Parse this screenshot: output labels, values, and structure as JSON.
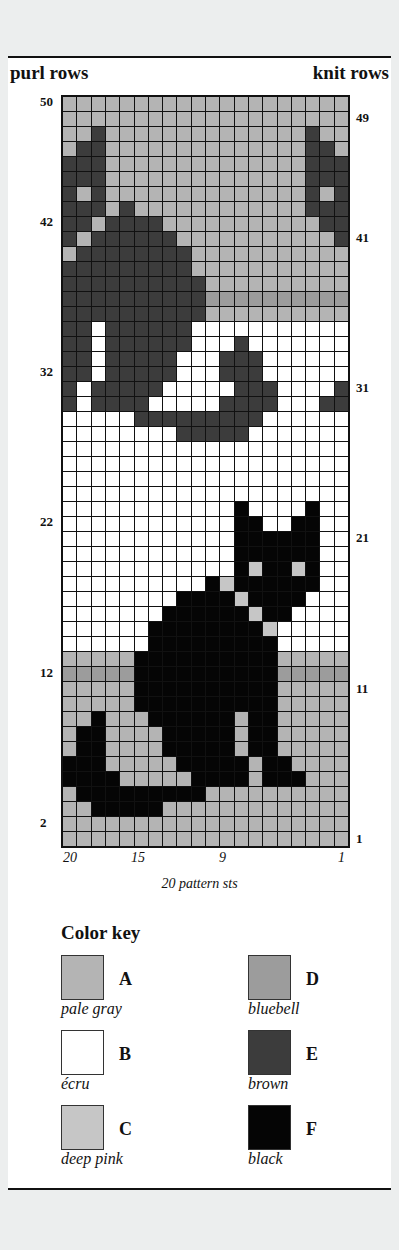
{
  "header": {
    "left": "purl rows",
    "right": "knit rows"
  },
  "row_labels_left": [
    {
      "text": "50",
      "top": 94
    },
    {
      "text": "42",
      "top": 214
    },
    {
      "text": "32",
      "top": 364
    },
    {
      "text": "22",
      "top": 514
    },
    {
      "text": "12",
      "top": 665
    },
    {
      "text": "2",
      "top": 815
    }
  ],
  "row_labels_right": [
    {
      "text": "49",
      "top": 110
    },
    {
      "text": "41",
      "top": 230
    },
    {
      "text": "31",
      "top": 380
    },
    {
      "text": "21",
      "top": 530
    },
    {
      "text": "11",
      "top": 681
    },
    {
      "text": "1",
      "top": 831
    }
  ],
  "col_labels": [
    {
      "text": "20",
      "left": 63
    },
    {
      "text": "15",
      "left": 131
    },
    {
      "text": "9",
      "left": 219
    },
    {
      "text": "1",
      "left": 338
    }
  ],
  "caption": "20 pattern sts",
  "colors": {
    "A": "#b4b4b4",
    "B": "#ffffff",
    "C": "#c6c6c6",
    "D": "#9c9c9c",
    "E": "#3c3c3c",
    "F": "#050505"
  },
  "color_key": {
    "title": "Color key",
    "items": [
      {
        "letter": "A",
        "name": "pale gray",
        "color": "#b4b4b4",
        "col": 0,
        "row": 0
      },
      {
        "letter": "B",
        "name": "écru",
        "color": "#ffffff",
        "col": 0,
        "row": 1
      },
      {
        "letter": "C",
        "name": "deep pink",
        "color": "#c6c6c6",
        "col": 0,
        "row": 2
      },
      {
        "letter": "D",
        "name": "bluebell",
        "color": "#9c9c9c",
        "col": 1,
        "row": 0
      },
      {
        "letter": "E",
        "name": "brown",
        "color": "#3c3c3c",
        "col": 1,
        "row": 1
      },
      {
        "letter": "F",
        "name": "black",
        "color": "#050505",
        "col": 1,
        "row": 2
      }
    ]
  },
  "grid": {
    "columns": 20,
    "rows": 50,
    "cells": [
      "AAAAAAAAAAAAAAAAAAAA",
      "AAAAAAAAAAAAAAAAAAAA",
      "AAEAAAAAAAAAAAAAAEAA",
      "AEEAAAAAAAAAAAAAAEEA",
      "EEEAAAAAAAAAAAAAAEEE",
      "EEEAAAAAAAAAAAAAAEEE",
      "EAEAAAAAAAAAAAAAAEAE",
      "EEEAEAAAAAAAAAAAAEEE",
      "EEAEEEEAAAAAAAAAAAEE",
      "EAEEEEEEAAAAAAAAAAAE",
      "AEEEEEEEEAAAAAAAAAAA",
      "EEEEEEEEEAAAAAAAAAAA",
      "EEEEEEEEEEAAAAAAAAAA",
      "EEEEEEEEEEDDDDDDDDDD",
      "EEEEEEEEEEAAAAAAAAAA",
      "EEBEEEEEEBBBBBBBBBBB",
      "EEBEEEEEEBBBEBBBBBBB",
      "EEBEEEEEBBBEEEBBBBBB",
      "EEBEEEEEBBBEEEBBBBBB",
      "EBEEEEEBBBBBEEEBBBBE",
      "EBEEEEBBBBBEEEEBBBEE",
      "BBBBBEEEEEEEEEBBBBBB",
      "BBBBBBBBEEEEEBBBBBBB",
      "BBBBBBBBBBBBBBBBBBBB",
      "BBBBBBBBBBBBBBBBBBBB",
      "BBBBBBBBBBBBBBBBBBBB",
      "BBBBBBBBBBBBBBBBBBBB",
      "BBBBBBBBBBBBFBBBBFBB",
      "BBBBBBBBBBBBFFBBFFBB",
      "BBBBBBBBBBBBFFFFFFBB",
      "BBBBBBBBBBBBFFFFFFBB",
      "BBBBBBBBBBBBFCFFCFBB",
      "BBBBBBBBBBFCFFFFFFBB",
      "BBBBBBBBFFFFCFFFFBBB",
      "BBBBBBBFFFFFFCFFBBBB",
      "BBBBBBFFFFFFFFCBBBBB",
      "BBBBBBFFFFFFFFFBBBBB",
      "AAAAAFFFFFFFFFFAAAAA",
      "DDDDDFFFFFFFFFFDDDDD",
      "AAAAAFFFFFFFFFFAAAAA",
      "AAAAAFFFFFFFFFFAAAAA",
      "AAFAAAFFFFFFAFFAAAAA",
      "AFFAAAAFFFFFAFFAAAAA",
      "AFFAAAAFFFFFAFFAAAAA",
      "FFFAAAAAFFFFFAFFAAAA",
      "FFFFAAAAAFFFFAFFFAAA",
      "AFFFFFFFFFAAAAAAAAAA",
      "AAFFFFFAAAAAAAAAAAAA",
      "AAAAAAAAAAAAAAAAAAAA",
      "AAAAAAAAAAAAAAAAAAAA"
    ]
  }
}
